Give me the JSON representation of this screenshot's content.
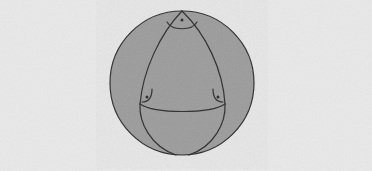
{
  "figure": {
    "domain": "geometry-illustration",
    "canvas": {
      "width": 372,
      "height": 171,
      "background_color": "#e9e9e9",
      "texture": "paper-grain-noise"
    },
    "sphere": {
      "name": "sphere-outline",
      "center_x": 182,
      "center_y": 83,
      "radius": 72,
      "fill_color": "#9d9d9d",
      "stroke_color": "#2b2b2b",
      "stroke_width": 1.2
    },
    "triangle": {
      "name": "spherical-triangle",
      "label": "spherical triangle",
      "fill_color": "none",
      "stroke_color": "#2b2b2b",
      "stroke_width": 1.2,
      "vertices": [
        {
          "name": "vertex-top",
          "label": "top vertex",
          "x": 182,
          "y": 11
        },
        {
          "name": "vertex-bottom-left",
          "label": "bottom-left vertex",
          "x": 140,
          "y": 104
        },
        {
          "name": "vertex-bottom-right",
          "label": "bottom-right vertex",
          "x": 225,
          "y": 104
        }
      ],
      "edges": [
        {
          "name": "edge-left",
          "label": "left great-circle arc",
          "path": "M 182 11 C 160 34, 143 70, 140 104"
        },
        {
          "name": "edge-right",
          "label": "right great-circle arc",
          "path": "M 182 11 C 206 34, 223 70, 225 104"
        },
        {
          "name": "edge-bottom",
          "label": "bottom great-circle arc",
          "path": "M 140 104 C 155 114, 210 114, 225 104"
        }
      ]
    },
    "angle_markers": [
      {
        "name": "right-angle-marker-top",
        "label": "right angle at top vertex",
        "arc_path": "M 167 22 C 172 31, 192 31, 197 22",
        "dot_x": 182,
        "dot_y": 20,
        "dot_radius": 1.5,
        "stroke_color": "#2b2b2b"
      },
      {
        "name": "right-angle-marker-bottom-left",
        "label": "right angle at bottom-left vertex",
        "arc_path": "M 152 89 C 152 98, 148 102, 142 102",
        "dot_x": 147,
        "dot_y": 97,
        "dot_radius": 1.5,
        "stroke_color": "#2b2b2b"
      },
      {
        "name": "right-angle-marker-bottom-right",
        "label": "right angle at bottom-right vertex",
        "arc_path": "M 213 89 C 213 98, 217 102, 223 102",
        "dot_x": 218,
        "dot_y": 97,
        "dot_radius": 1.5,
        "stroke_color": "#2b2b2b"
      }
    ],
    "meridian_guides": [
      {
        "name": "meridian-left-continuation",
        "label": "left arc continuing below triangle",
        "path": "M 140 104 C 139 122, 150 146, 176 155"
      },
      {
        "name": "meridian-right-continuation",
        "label": "right arc continuing below triangle",
        "path": "M 225 104 C 226 122, 215 146, 189 155"
      }
    ]
  }
}
